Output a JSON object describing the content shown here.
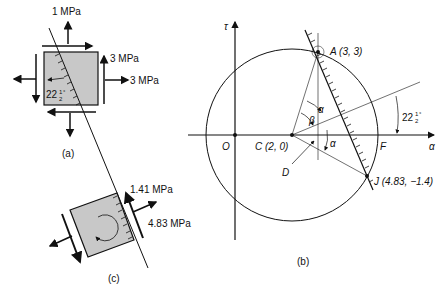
{
  "figure_a": {
    "label": "(a)",
    "stress_top": "1 MPa",
    "shear_right": "3 MPa",
    "normal_right": "3 MPa",
    "angle": "22",
    "angle_frac_num": "1",
    "angle_frac_den": "2",
    "angle_deg": "°"
  },
  "figure_b": {
    "label": "(b)",
    "tau_axis": "τ",
    "sigma_axis": "α",
    "point_O": "O",
    "point_C": "C (2, 0)",
    "point_A": "A (3, 3)",
    "point_F": "F",
    "point_D": "D",
    "point_J": "J (4.83, −1.4)",
    "alpha_upper": "α",
    "beta": "β",
    "alpha_lower": "α",
    "angle": "22",
    "angle_frac_num": "1",
    "angle_frac_den": "2",
    "angle_deg": "°"
  },
  "figure_c": {
    "label": "(c)",
    "shear": "1.41 MPa",
    "normal": "4.83 MPa"
  },
  "colors": {
    "ink": "#111111",
    "element_fill": "#c8c8c8"
  }
}
